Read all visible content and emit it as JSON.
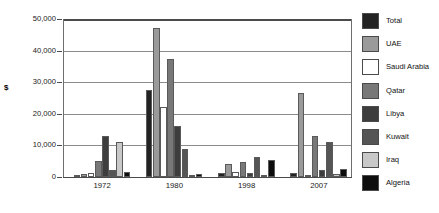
{
  "chart_data": {
    "type": "bar",
    "title": "",
    "subtitle": "",
    "xlabel": "",
    "ylabel": "$",
    "categories": [
      "1972",
      "1980",
      "1998",
      "2007"
    ],
    "ylim": [
      0,
      50000
    ],
    "y_ticks": [
      {
        "value": 50000,
        "label": "50,000"
      },
      {
        "value": 40000,
        "label": "40,000"
      },
      {
        "value": 30000,
        "label": "30,000"
      },
      {
        "value": 20000,
        "label": "20,000"
      },
      {
        "value": 10000,
        "label": "10,000"
      },
      {
        "value": 0,
        "label": "0"
      }
    ],
    "grid": true,
    "legend_position": "right",
    "series": [
      {
        "name": "Total",
        "color": "#232323",
        "values": [
          400,
          27500,
          1300,
          1200
        ]
      },
      {
        "name": "UAE",
        "color": "#9a9a9a",
        "values": [
          800,
          47000,
          4000,
          26500
        ]
      },
      {
        "name": "Saudi Arabia",
        "color": "#ffffff",
        "values": [
          1200,
          22000,
          1500,
          400
        ]
      },
      {
        "name": "Qatar",
        "color": "#787878",
        "values": [
          5000,
          37500,
          4600,
          13000
        ]
      },
      {
        "name": "Libya",
        "color": "#3d3d3d",
        "values": [
          12900,
          16000,
          1400,
          2100
        ]
      },
      {
        "name": "Kuwait",
        "color": "#555555",
        "values": [
          2300,
          9000,
          6200,
          11000
        ]
      },
      {
        "name": "Iraq",
        "color": "#c8c8c8",
        "values": [
          11200,
          400,
          300,
          800
        ]
      },
      {
        "name": "Algeria",
        "color": "#0d0d0d",
        "values": [
          1500,
          1000,
          5300,
          2600
        ]
      }
    ]
  },
  "legend": {
    "items": [
      {
        "label": "Total"
      },
      {
        "label": "UAE"
      },
      {
        "label": "Saudi Arabia"
      },
      {
        "label": "Qatar"
      },
      {
        "label": "Libya"
      },
      {
        "label": "Kuwait"
      },
      {
        "label": "Iraq"
      },
      {
        "label": "Algeria"
      }
    ]
  },
  "colors": {
    "axis": "#4a4a4a",
    "gridline": "#8c8c8c",
    "text": "#111111",
    "background": "#ffffff"
  }
}
